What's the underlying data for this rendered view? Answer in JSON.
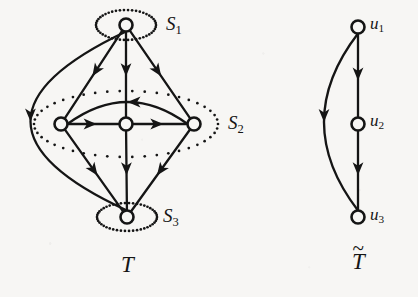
{
  "figure": {
    "background_color": "#f7f6f4",
    "ink_color": "#151515",
    "graphs": [
      {
        "id": "T",
        "caption": "T",
        "caption_x": 121,
        "caption_y": 253,
        "nodes": [
          {
            "id": "s1",
            "cx": 126,
            "cy": 25,
            "r": 6.5,
            "group": "S1"
          },
          {
            "id": "s2a",
            "cx": 61,
            "cy": 124,
            "r": 6.5,
            "group": "S2"
          },
          {
            "id": "s2b",
            "cx": 126,
            "cy": 124,
            "r": 6.5,
            "group": "S2"
          },
          {
            "id": "s2c",
            "cx": 194,
            "cy": 124,
            "r": 6.5,
            "group": "S2"
          },
          {
            "id": "s3",
            "cx": 127,
            "cy": 217,
            "r": 6.5,
            "group": "S3"
          }
        ],
        "groups": [
          {
            "id": "S1",
            "label": "S",
            "subscript": "1",
            "cx": 126,
            "cy": 25,
            "rx": 30,
            "ry": 15,
            "label_x": 166,
            "label_y": 14
          },
          {
            "id": "S2",
            "label": "S",
            "subscript": "2",
            "cx": 126,
            "cy": 124,
            "rx": 92,
            "ry": 33,
            "label_x": 228,
            "label_y": 113
          },
          {
            "id": "S3",
            "label": "S",
            "subscript": "3",
            "cx": 127,
            "cy": 217,
            "rx": 30,
            "ry": 14,
            "label_x": 163,
            "label_y": 206
          }
        ],
        "edges": [
          {
            "from": "s1",
            "to": "s2a",
            "kind": "straight",
            "arrow_t": 0.52
          },
          {
            "from": "s1",
            "to": "s2b",
            "kind": "straight",
            "arrow_t": 0.52
          },
          {
            "from": "s1",
            "to": "s2c",
            "kind": "straight",
            "arrow_t": 0.52
          },
          {
            "from": "s2a",
            "to": "s2b",
            "kind": "straight",
            "arrow_t": 0.56
          },
          {
            "from": "s2b",
            "to": "s2c",
            "kind": "straight",
            "arrow_t": 0.56
          },
          {
            "from": "s2c",
            "to": "s2a",
            "kind": "curved",
            "arrow_t": 0.5,
            "bow": 22
          },
          {
            "from": "s2a",
            "to": "s3",
            "kind": "straight",
            "arrow_t": 0.56
          },
          {
            "from": "s2b",
            "to": "s3",
            "kind": "straight",
            "arrow_t": 0.56
          },
          {
            "from": "s2c",
            "to": "s3",
            "kind": "straight",
            "arrow_t": 0.56
          },
          {
            "from": "s1",
            "to": "s3",
            "kind": "bigarc",
            "arrow_t": 0.5,
            "bow": 96
          }
        ]
      },
      {
        "id": "Ttilde",
        "caption": "T",
        "caption_tilde": "~",
        "caption_x": 352,
        "caption_y": 250,
        "nodes": [
          {
            "id": "u1",
            "cx": 358,
            "cy": 27,
            "r": 6.5,
            "label": "u",
            "subscript": "1",
            "label_x": 370,
            "label_y": 15
          },
          {
            "id": "u2",
            "cx": 358,
            "cy": 124,
            "r": 6.5,
            "label": "u",
            "subscript": "2",
            "label_x": 370,
            "label_y": 112
          },
          {
            "id": "u3",
            "cx": 358,
            "cy": 217,
            "r": 6.5,
            "label": "u",
            "subscript": "3",
            "label_x": 370,
            "label_y": 206
          }
        ],
        "edges": [
          {
            "from": "u1",
            "to": "u2",
            "kind": "straight",
            "arrow_t": 0.56
          },
          {
            "from": "u2",
            "to": "u3",
            "kind": "straight",
            "arrow_t": 0.56
          },
          {
            "from": "u1",
            "to": "u3",
            "kind": "bigarc",
            "arrow_t": 0.5,
            "bow": 34
          }
        ]
      }
    ]
  }
}
